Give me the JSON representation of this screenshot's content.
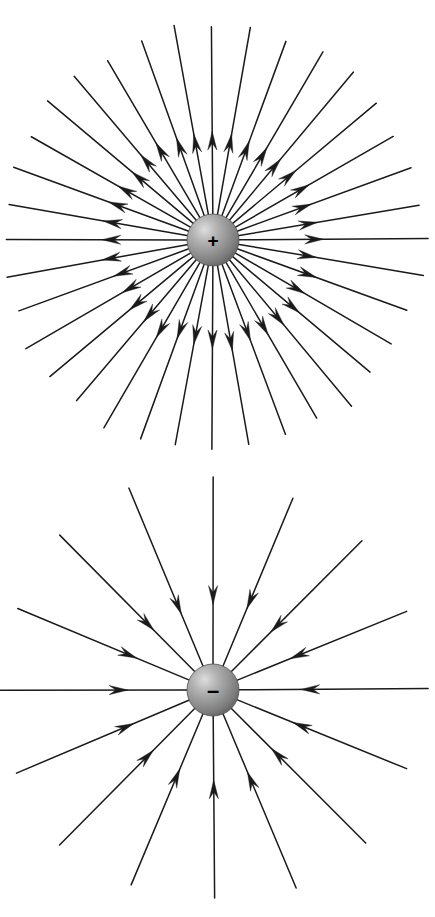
{
  "figure": {
    "background_color": "#ffffff",
    "line_color": "#1a1a1a",
    "sphere_colors": {
      "highlight": "#d8d8d8",
      "mid": "#9a9a9a",
      "edge": "#6e6e6e",
      "rim": "#555555"
    }
  },
  "panels": [
    {
      "id": "positive-charge-field",
      "name": "positive-point-charge",
      "charge_sign": "+",
      "charge_label": "+",
      "field_direction": "outward",
      "description": "Radially outward electric field lines from a positive point charge",
      "center": {
        "x": 213,
        "y": 240
      },
      "sphere_radius": 26,
      "line_count": 36,
      "angle_step_deg": 10,
      "arrow_radius": 100,
      "line_outer_radius": 212
    },
    {
      "id": "negative-charge-field",
      "name": "negative-point-charge",
      "charge_sign": "-",
      "charge_label": "–",
      "field_direction": "inward",
      "description": "Radially inward electric field lines toward a negative point charge",
      "center": {
        "x": 213,
        "y": 230
      },
      "sphere_radius": 26,
      "line_count": 16,
      "angle_step_deg": 22.5,
      "arrow_radius": 95,
      "line_outer_radius": 212
    }
  ],
  "chart_data": {
    "type": "scatter",
    "subtitle": "",
    "xlabel": "",
    "ylabel": "",
    "grid": false,
    "legend": "none",
    "series": [
      {
        "name": "positive point charge field lines",
        "charge": "+",
        "field_direction": "outward",
        "radial_lines": 36,
        "angle_step_deg": 10,
        "arrowhead_radius_px": 100,
        "line_length_px": 212,
        "sphere_radius_px": 26,
        "center_px": [
          213,
          240
        ],
        "angles_deg": [
          0,
          10,
          20,
          30,
          40,
          50,
          60,
          70,
          80,
          90,
          100,
          110,
          120,
          130,
          140,
          150,
          160,
          170,
          180,
          190,
          200,
          210,
          220,
          230,
          240,
          250,
          260,
          270,
          280,
          290,
          300,
          310,
          320,
          330,
          340,
          350
        ]
      },
      {
        "name": "negative point charge field lines",
        "charge": "-",
        "field_direction": "inward",
        "radial_lines": 16,
        "angle_step_deg": 22.5,
        "arrowhead_radius_px": 95,
        "line_length_px": 212,
        "sphere_radius_px": 26,
        "center_px": [
          213,
          690
        ],
        "angles_deg": [
          0,
          22.5,
          45,
          67.5,
          90,
          112.5,
          135,
          157.5,
          180,
          202.5,
          225,
          247.5,
          270,
          292.5,
          315,
          337.5
        ]
      }
    ]
  }
}
